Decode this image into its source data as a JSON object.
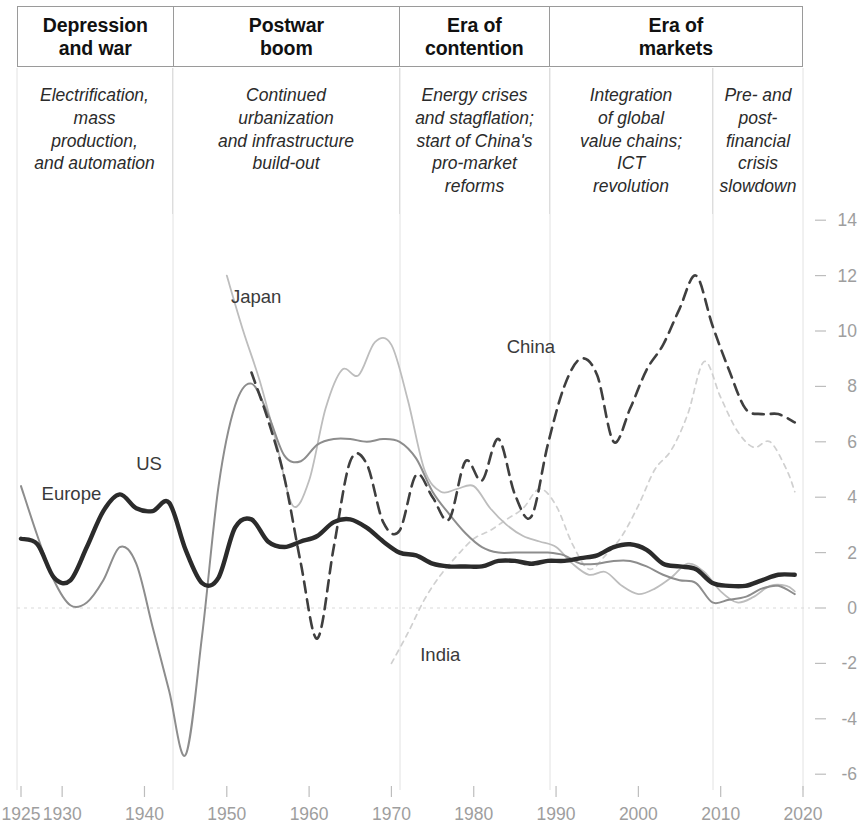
{
  "eras": [
    {
      "title": "Depression\nand war"
    },
    {
      "title": "Postwar\nboom"
    },
    {
      "title": "Era of\ncontention"
    },
    {
      "title": "Era of\nmarkets"
    }
  ],
  "era_titles": {
    "e0": "Depression and war",
    "e1": "Postwar boom",
    "e2": "Era of contention",
    "e3": "Era of markets"
  },
  "captions": {
    "c0": "Electrification, mass production, and automation",
    "c1": "Continued urbanization and infrastructure build-out",
    "c2": "Energy crises and stagflation; start of China's pro-market reforms",
    "c3": "Integration of global value chains; ICT revolution",
    "c4": "Pre- and post-financial crisis slowdown"
  },
  "chart_data": {
    "type": "line",
    "title": "",
    "subtitle": "",
    "xlabel": "",
    "ylabel": "",
    "xlim": [
      1925,
      2020
    ],
    "ylim": [
      -6,
      14
    ],
    "grid": false,
    "legend": "inline-labels",
    "xticks": [
      1925,
      1930,
      1940,
      1950,
      1960,
      1970,
      1980,
      1990,
      2000,
      2010,
      2020
    ],
    "xtick_labels": [
      "1925",
      "1930",
      "1940",
      "1950",
      "1960",
      "1970",
      "1980",
      "1990",
      "2000",
      "2010",
      "2020"
    ],
    "yticks": [
      -6,
      -4,
      -2,
      0,
      2,
      4,
      6,
      8,
      10,
      12,
      14
    ],
    "ytick_labels": [
      "-6",
      "-4",
      "-2",
      "0",
      "2",
      "4",
      "6",
      "8",
      "10",
      "12",
      "14"
    ],
    "annotations": [
      {
        "text": "Europe",
        "x": 1927.5,
        "y": 3.9
      },
      {
        "text": "US",
        "x": 1939.0,
        "y": 5.0
      },
      {
        "text": "Japan",
        "x": 1950.5,
        "y": 11.0
      },
      {
        "text": "China",
        "x": 1984.0,
        "y": 9.2
      },
      {
        "text": "India",
        "x": 1973.5,
        "y": -1.9
      }
    ],
    "series": [
      {
        "name": "US",
        "style": "solid-thick-dark",
        "color": "#2b2b2b",
        "width": 4.4,
        "x": [
          1925,
          1927,
          1929,
          1931,
          1933,
          1935,
          1937,
          1939,
          1941,
          1943,
          1945,
          1947,
          1949,
          1951,
          1953,
          1955,
          1957,
          1959,
          1961,
          1963,
          1965,
          1967,
          1969,
          1971,
          1973,
          1975,
          1977,
          1979,
          1981,
          1983,
          1985,
          1987,
          1989,
          1991,
          1993,
          1995,
          1997,
          1999,
          2001,
          2003,
          2005,
          2007,
          2009,
          2011,
          2013,
          2015,
          2017,
          2019
        ],
        "values": [
          2.5,
          2.3,
          1.1,
          1.0,
          2.2,
          3.5,
          4.1,
          3.6,
          3.5,
          3.8,
          2.1,
          0.9,
          1.1,
          2.9,
          3.2,
          2.4,
          2.2,
          2.4,
          2.6,
          3.1,
          3.2,
          2.9,
          2.4,
          2.0,
          1.9,
          1.6,
          1.5,
          1.5,
          1.5,
          1.7,
          1.7,
          1.6,
          1.7,
          1.7,
          1.8,
          1.9,
          2.2,
          2.3,
          2.1,
          1.6,
          1.5,
          1.4,
          0.9,
          0.8,
          0.8,
          1.0,
          1.2,
          1.2
        ]
      },
      {
        "name": "Europe",
        "style": "solid-medium-gray",
        "color": "#8d8d8d",
        "width": 2.0,
        "x": [
          1925,
          1927,
          1929,
          1931,
          1933,
          1935,
          1937,
          1939,
          1941,
          1943,
          1945,
          1947,
          1949,
          1951,
          1953,
          1955,
          1957,
          1959,
          1961,
          1963,
          1965,
          1967,
          1969,
          1971,
          1973,
          1975,
          1977,
          1979,
          1981,
          1983,
          1985,
          1987,
          1989,
          1991,
          1993,
          1995,
          1997,
          1999,
          2001,
          2003,
          2005,
          2007,
          2009,
          2011,
          2013,
          2015,
          2017,
          2019
        ],
        "values": [
          4.4,
          2.6,
          1.0,
          0.1,
          0.2,
          1.0,
          2.2,
          1.6,
          -0.7,
          -3.0,
          -5.3,
          -1.0,
          4.4,
          7.3,
          8.1,
          7.0,
          5.5,
          5.3,
          5.9,
          6.1,
          6.1,
          6.0,
          6.1,
          6.0,
          5.4,
          4.2,
          3.4,
          2.7,
          2.2,
          2.0,
          2.0,
          2.0,
          2.0,
          1.9,
          1.6,
          1.6,
          1.7,
          1.7,
          1.5,
          1.2,
          1.0,
          0.9,
          0.2,
          0.3,
          0.4,
          0.7,
          0.8,
          0.5
        ]
      },
      {
        "name": "Japan",
        "style": "solid-thin-light",
        "color": "#bdbdbd",
        "width": 1.8,
        "x": [
          1950,
          1952,
          1954,
          1956,
          1958,
          1960,
          1962,
          1964,
          1966,
          1968,
          1970,
          1972,
          1974,
          1976,
          1978,
          1980,
          1982,
          1984,
          1986,
          1988,
          1990,
          1992,
          1994,
          1996,
          1998,
          2000,
          2002,
          2004,
          2006,
          2008,
          2010,
          2012,
          2014,
          2016,
          2018,
          2019
        ],
        "values": [
          12.0,
          10.0,
          8.2,
          6.0,
          3.7,
          4.6,
          7.2,
          8.6,
          8.4,
          9.6,
          9.5,
          7.5,
          5.0,
          4.2,
          4.3,
          4.4,
          3.6,
          3.0,
          2.6,
          2.4,
          2.2,
          1.6,
          1.2,
          1.3,
          0.8,
          0.5,
          0.7,
          1.1,
          1.6,
          1.3,
          0.6,
          0.2,
          0.4,
          0.8,
          0.8,
          0.6
        ]
      },
      {
        "name": "China",
        "style": "dashed-dark",
        "color": "#3f3f3f",
        "width": 2.6,
        "x": [
          1953,
          1955,
          1957,
          1959,
          1961,
          1963,
          1965,
          1967,
          1969,
          1971,
          1973,
          1975,
          1977,
          1979,
          1981,
          1983,
          1985,
          1987,
          1989,
          1991,
          1993,
          1995,
          1997,
          1999,
          2001,
          2003,
          2005,
          2007,
          2009,
          2011,
          2013,
          2015,
          2017,
          2019
        ],
        "values": [
          8.5,
          6.8,
          4.7,
          1.6,
          -1.1,
          2.2,
          5.3,
          5.2,
          3.1,
          2.8,
          4.8,
          4.0,
          3.2,
          5.3,
          4.6,
          6.1,
          4.1,
          3.3,
          5.9,
          8.0,
          9.0,
          8.4,
          6.0,
          7.2,
          8.6,
          9.5,
          10.8,
          12.0,
          10.2,
          8.6,
          7.2,
          7.0,
          7.0,
          6.7
        ]
      },
      {
        "name": "India",
        "style": "dotted-light",
        "color": "#d0d0d0",
        "width": 1.7,
        "x": [
          1970,
          1972,
          1974,
          1976,
          1978,
          1980,
          1982,
          1984,
          1986,
          1988,
          1990,
          1992,
          1994,
          1996,
          1998,
          2000,
          2002,
          2004,
          2006,
          2008,
          2010,
          2012,
          2014,
          2016,
          2018,
          2019
        ],
        "values": [
          -2.0,
          -0.9,
          0.3,
          1.2,
          1.9,
          2.5,
          2.8,
          3.2,
          3.6,
          4.3,
          3.7,
          2.3,
          1.4,
          1.9,
          2.6,
          3.7,
          5.0,
          5.7,
          7.0,
          8.9,
          7.6,
          6.4,
          5.8,
          6.0,
          5.0,
          4.2
        ]
      }
    ]
  }
}
